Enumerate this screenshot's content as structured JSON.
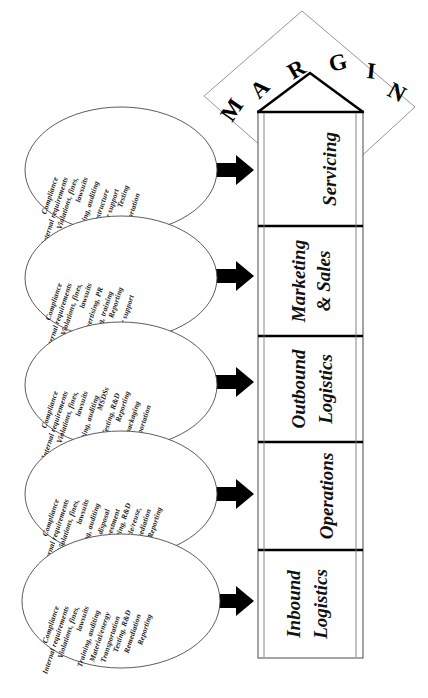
{
  "diagram": {
    "type": "value-chain",
    "orientation": "rotated-90-counterclockwise",
    "margin_label": "MARGIN",
    "margin_letters": [
      "M",
      "A",
      "R",
      "G",
      "I",
      "N"
    ]
  },
  "chain": {
    "segments": [
      {
        "id": "servicing",
        "label": "Servicing",
        "label_lines": [
          "Servicing"
        ]
      },
      {
        "id": "marketing-sales",
        "label": "Marketing & Sales",
        "label_lines": [
          "Marketing",
          "& Sales"
        ]
      },
      {
        "id": "outbound-logistics",
        "label": "Outbound Logistics",
        "label_lines": [
          "Outbound",
          "Logistics"
        ]
      },
      {
        "id": "operations",
        "label": "Operations",
        "label_lines": [
          "Operations"
        ]
      },
      {
        "id": "inbound-logistics",
        "label": "Inbound Logistics",
        "label_lines": [
          "Inbound",
          "Logistics"
        ]
      }
    ]
  },
  "ellipses": [
    {
      "id": "servicing-issues",
      "for_segment": "Servicing",
      "items": [
        "Compliance",
        "Internal requirements",
        "Violations, fines,",
        "lawsuits",
        "Training, auditing",
        "Recycling infrastructure",
        "Customer support",
        "Testing",
        "Transportation"
      ]
    },
    {
      "id": "marketing-sales-issues",
      "for_segment": "Marketing & Sales",
      "items": [
        "Compliance",
        "Internal requirements",
        "Violations, fines,",
        "lawsuits",
        "Advertising, PR",
        "Auditing, training",
        "Reporting",
        "Customer support"
      ]
    },
    {
      "id": "outbound-logistics-issues",
      "for_segment": "Outbound Logistics",
      "items": [
        "Compliance",
        "Internal requirements",
        "Violations, fines,",
        "lawsuits",
        "Training, auditing",
        "MSDSs",
        "Testing, R&D",
        "Reporting",
        "Labeling, packaging",
        "Transportation"
      ]
    },
    {
      "id": "operations-issues",
      "for_segment": "Operations",
      "items": [
        "Compliance",
        "Internal requirements",
        "Violations, fines,",
        "lawsuits",
        "Training, auditing",
        "Waste/waste disposal",
        "Capital investment",
        "Testing, R&D",
        "Recycle/reuse,",
        "Remediation",
        "Reporting"
      ]
    },
    {
      "id": "inbound-logistics-issues",
      "for_segment": "Inbound Logistics",
      "items": [
        "Compliance",
        "Internal requirements",
        "Violations, fines,",
        "lawsuits",
        "Training, auditing",
        "Material/energy",
        "Transportation",
        "Testing, R&D",
        "Remediation",
        "Reporting"
      ]
    }
  ],
  "colors": {
    "background": "#ffffff",
    "stroke": "#000000",
    "light_stroke": "#6a6a6a",
    "text": "#111111"
  }
}
